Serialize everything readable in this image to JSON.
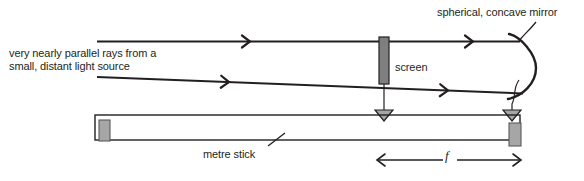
{
  "diagram": {
    "labels": {
      "source": "very nearly parallel rays from a\nsmall, distant light source",
      "screen": "screen",
      "mirror": "spherical, concave mirror",
      "metre_stick": "metre stick",
      "focal_length": "f"
    },
    "icons": {
      "ray_arrow": "arrow-right-chevron",
      "pointer": "down-triangle-pointer",
      "dimension_arrow": "double-headed-arrow"
    },
    "colors": {
      "line": "#231f20",
      "text": "#231f20",
      "screen_fill": "#7f7f7f",
      "slider_fill": "#a6a6a6",
      "slider_stroke": "#595959",
      "pointer_fill": "#a6a6a6",
      "background": "#ffffff"
    },
    "geometry": {
      "upper_ray": {
        "x1": 97,
        "y1": 41,
        "x2": 520,
        "y2": 41
      },
      "lower_ray": {
        "x1": 97,
        "y1": 77,
        "x2": 520,
        "y2": 93
      },
      "screen": {
        "x": 379,
        "y": 37,
        "width": 10,
        "height": 47
      },
      "mirror_arc": {
        "top_x": 512,
        "top_y": 40,
        "bottom_x": 512,
        "bottom_y": 98,
        "bulge": 546
      },
      "metre_stick": {
        "x": 95,
        "y": 115,
        "width": 425,
        "height": 25
      },
      "slider_left": {
        "x": 99,
        "y": 121,
        "width": 11,
        "height": 20
      },
      "slider_right": {
        "x": 509,
        "y": 124,
        "width": 12,
        "height": 22
      },
      "pointer_screen_x": 384,
      "pointer_mirror_x": 512,
      "focal_span": {
        "x1": 375,
        "x2": 520,
        "y": 160
      }
    }
  }
}
